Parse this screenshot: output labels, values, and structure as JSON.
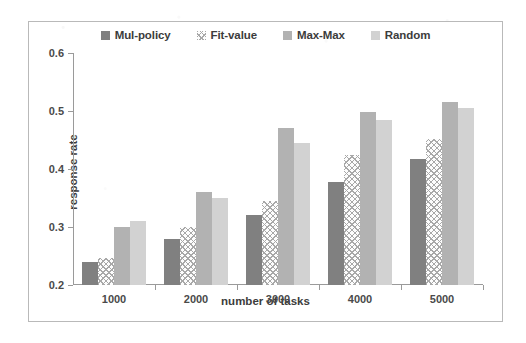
{
  "chart_data": {
    "type": "bar",
    "title": "",
    "xlabel": "number of tasks",
    "ylabel": "response rate",
    "categories": [
      "1000",
      "2000",
      "3000",
      "4000",
      "5000"
    ],
    "ylim": [
      0.2,
      0.6
    ],
    "yticks": [
      "0.2",
      "0.3",
      "0.4",
      "0.5",
      "0.6"
    ],
    "grid": false,
    "legend_position": "top-center",
    "series": [
      {
        "name": "Mul-policy",
        "color": "#808080",
        "fill": "solid",
        "values": [
          0.24,
          0.28,
          0.32,
          0.378,
          0.417
        ]
      },
      {
        "name": "Fit-value",
        "color": "#fdfdfd",
        "fill": "crosshatch",
        "values": [
          0.247,
          0.3,
          0.345,
          0.425,
          0.452
        ]
      },
      {
        "name": "Max-Max",
        "color": "#b2b2b2",
        "fill": "solid",
        "values": [
          0.3,
          0.36,
          0.47,
          0.498,
          0.516
        ]
      },
      {
        "name": "Random",
        "color": "#d2d2d2",
        "fill": "solid",
        "values": [
          0.31,
          0.35,
          0.445,
          0.485,
          0.506
        ]
      }
    ]
  },
  "legend": {
    "items": [
      {
        "label": "Mul-policy"
      },
      {
        "label": "Fit-value"
      },
      {
        "label": "Max-Max"
      },
      {
        "label": "Random"
      }
    ]
  },
  "axes": {
    "y_title": "response rate",
    "x_title": "number of tasks",
    "y_tick_labels": [
      "0.6",
      "0.5",
      "0.4",
      "0.3",
      "0.2"
    ],
    "x_tick_labels": [
      "1000",
      "2000",
      "3000",
      "4000",
      "5000"
    ]
  }
}
